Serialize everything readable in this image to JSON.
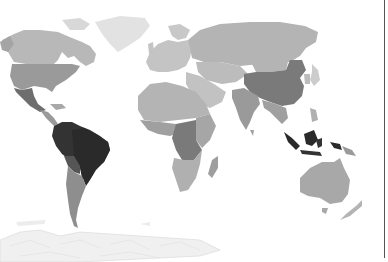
{
  "map": {
    "type": "choropleth",
    "projection": "world (equirectangular-like)",
    "color_scheme": "grayscale",
    "shades": {
      "darkest": "#2a2a2a",
      "dark": "#555555",
      "medium_dark": "#7a7a7a",
      "medium": "#9a9a9a",
      "light": "#b4b4b4",
      "lighter": "#c8c8c8",
      "lightest": "#e2e2e2",
      "antarctica": "#f0f0f0",
      "background": "#ffffff",
      "frame": "#555555"
    },
    "regions": [
      {
        "name": "Canada",
        "shade": "light"
      },
      {
        "name": "United States",
        "shade": "medium"
      },
      {
        "name": "Mexico",
        "shade": "dark"
      },
      {
        "name": "Central America",
        "shade": "medium"
      },
      {
        "name": "Greenland",
        "shade": "lightest"
      },
      {
        "name": "Brazil",
        "shade": "darkest"
      },
      {
        "name": "Colombia / Peru / Venezuela",
        "shade": "darkest"
      },
      {
        "name": "Bolivia / Paraguay",
        "shade": "dark"
      },
      {
        "name": "Argentina / Chile",
        "shade": "medium"
      },
      {
        "name": "Europe",
        "shade": "lighter"
      },
      {
        "name": "Russia",
        "shade": "light"
      },
      {
        "name": "Middle East",
        "shade": "lighter"
      },
      {
        "name": "North Africa",
        "shade": "light"
      },
      {
        "name": "Central Africa",
        "shade": "medium_dark"
      },
      {
        "name": "West Africa",
        "shade": "medium"
      },
      {
        "name": "Southern Africa",
        "shade": "light"
      },
      {
        "name": "Madagascar",
        "shade": "medium"
      },
      {
        "name": "China",
        "shade": "medium_dark"
      },
      {
        "name": "Mongolia",
        "shade": "light"
      },
      {
        "name": "India",
        "shade": "medium"
      },
      {
        "name": "Southeast Asia",
        "shade": "medium"
      },
      {
        "name": "Indonesia",
        "shade": "darkest"
      },
      {
        "name": "Papua New Guinea",
        "shade": "medium"
      },
      {
        "name": "Australia",
        "shade": "light"
      },
      {
        "name": "New Zealand",
        "shade": "light"
      },
      {
        "name": "Japan",
        "shade": "lighter"
      },
      {
        "name": "Antarctica",
        "shade": "antarctica"
      }
    ]
  }
}
